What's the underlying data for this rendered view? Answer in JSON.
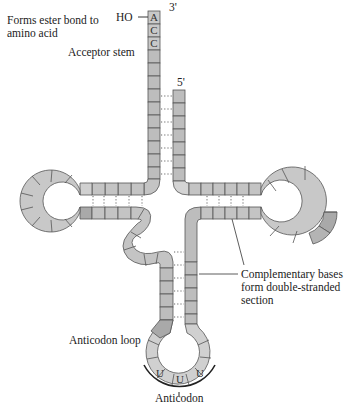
{
  "figure": {
    "labels": {
      "three_prime": "3'",
      "five_prime": "5'",
      "hydroxyl": "HO",
      "ester_bond_line1": "Forms ester bond to",
      "ester_bond_line2": "amino acid",
      "acceptor_stem": "Acceptor stem",
      "complementary_line1": "Complementary bases",
      "complementary_line2": "form double-stranded",
      "complementary_line3": "section",
      "anticodon_loop": "Anticodon loop",
      "anticodon": "Anticodon"
    },
    "acceptor_end_bases": [
      "A",
      "C",
      "C"
    ],
    "anticodon_bases": [
      "U",
      "U",
      "U"
    ],
    "colors": {
      "nucleotide_light": "#d4d4d4",
      "nucleotide_mid": "#bdbdbd",
      "nucleotide_dark": "#a8a8a8",
      "outline": "#555555",
      "text": "#222222"
    }
  }
}
